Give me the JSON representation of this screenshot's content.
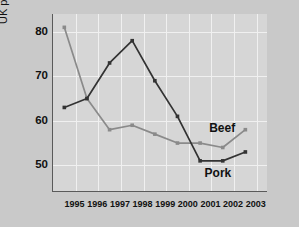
{
  "chart_data": {
    "type": "line",
    "title": "",
    "xlabel": "",
    "ylabel": "UK production ('000 tonnes)",
    "xlim": [
      1994,
      2003.5
    ],
    "ylim": [
      44,
      84
    ],
    "yticks": [
      50,
      60,
      70,
      80
    ],
    "xticks": [
      1995,
      1996,
      1997,
      1998,
      1999,
      2000,
      2001,
      2002,
      2003
    ],
    "xtick_labels": [
      "1995",
      "1996",
      "1997",
      "1998",
      "1999",
      "2000",
      "2001",
      "2002",
      "2003"
    ],
    "grid": true,
    "legend_position": "inline-annotation",
    "x": [
      1994.5,
      1995.5,
      1996.5,
      1997.5,
      1998.5,
      1999.5,
      2000.5,
      2001.5,
      2002.5
    ],
    "series": [
      {
        "name": "Beef",
        "color": "#8a8a8a",
        "marker": "square",
        "values": [
          81,
          65,
          58,
          59,
          57,
          55,
          55,
          54,
          58
        ]
      },
      {
        "name": "Pork",
        "color": "#333333",
        "marker": "square",
        "values": [
          63,
          65,
          73,
          78,
          69,
          61,
          51,
          51,
          53
        ]
      }
    ],
    "annotations": [
      {
        "text": "Beef",
        "x": 2000.9,
        "y": 58.4
      },
      {
        "text": "Pork",
        "x": 2000.7,
        "y": 48.2
      }
    ],
    "colors": {
      "background": "#c9c9c9",
      "plot_background": "#d6d6d6",
      "gridline": "#f0f0f0",
      "axis": "#5a5a5a",
      "text": "#111111",
      "beef": "#8a8a8a",
      "pork": "#333333"
    }
  }
}
